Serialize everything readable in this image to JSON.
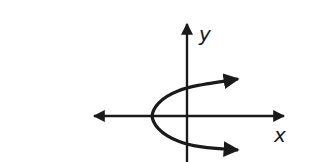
{
  "figure": {
    "axes": {
      "x_label": "x",
      "y_label": "y"
    },
    "curve": {
      "type": "parabola",
      "opens": "right",
      "vertex": "on negative x-axis",
      "arrows": "both ends"
    },
    "colors": {
      "ink": "#1a1a1a",
      "background": "#ffffff"
    }
  }
}
